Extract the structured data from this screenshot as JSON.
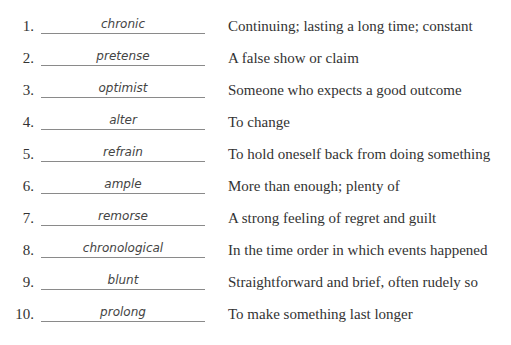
{
  "items": [
    {
      "number": "1.",
      "answer": "chronic",
      "definition": "Continuing; lasting a long time; constant"
    },
    {
      "number": "2.",
      "answer": "pretense",
      "definition": "A false show or claim"
    },
    {
      "number": "3.",
      "answer": "optimist",
      "definition": "Someone who expects a good outcome"
    },
    {
      "number": "4.",
      "answer": "alter",
      "definition": "To change"
    },
    {
      "number": "5.",
      "answer": "refrain",
      "definition": "To hold oneself back from doing something"
    },
    {
      "number": "6.",
      "answer": "ample",
      "definition": "More than enough; plenty of"
    },
    {
      "number": "7.",
      "answer": "remorse",
      "definition": "A strong feeling of regret and guilt"
    },
    {
      "number": "8.",
      "answer": "chronological",
      "definition": "In the time order in which events happened"
    },
    {
      "number": "9.",
      "answer": "blunt",
      "definition": "Straightforward and brief, often rudely so"
    },
    {
      "number": "10.",
      "answer": "prolong",
      "definition": "To make something last longer"
    }
  ]
}
